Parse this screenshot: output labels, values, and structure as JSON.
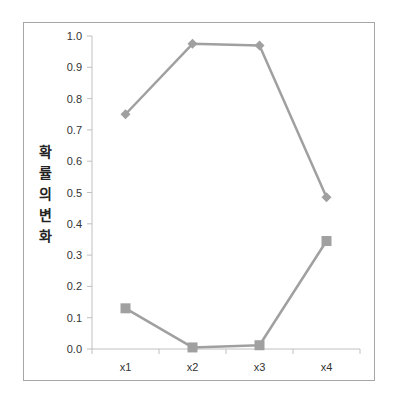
{
  "chart_data": {
    "type": "line",
    "title": "",
    "xlabel": "",
    "ylabel": "확률의변화",
    "categories": [
      "x1",
      "x2",
      "x3",
      "x4"
    ],
    "ylim": [
      0.0,
      1.0
    ],
    "yticks": [
      "0.0",
      "0.1",
      "0.2",
      "0.3",
      "0.4",
      "0.5",
      "0.6",
      "0.7",
      "0.8",
      "0.9",
      "1.0"
    ],
    "grid": false,
    "legend": null,
    "series": [
      {
        "name": "series-1",
        "marker": "diamond",
        "color": "#a0a0a0",
        "values": [
          0.75,
          0.975,
          0.97,
          0.485
        ]
      },
      {
        "name": "series-2",
        "marker": "square",
        "color": "#a0a0a0",
        "values": [
          0.13,
          0.005,
          0.012,
          0.345
        ]
      }
    ]
  },
  "axis": {
    "ylabel_chars": [
      "확",
      "률",
      "의",
      "변",
      "화"
    ]
  }
}
